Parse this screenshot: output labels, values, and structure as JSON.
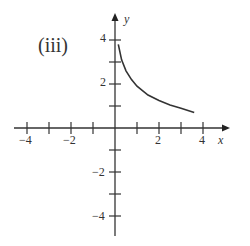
{
  "chart_data": {
    "type": "line",
    "title": "(iii)",
    "xlabel": "x",
    "ylabel": "y",
    "xlim": [
      -4.5,
      5
    ],
    "ylim": [
      -4.5,
      5
    ],
    "grid": false,
    "x_tick_labels": [
      "-4",
      "-2",
      "2",
      "4"
    ],
    "y_tick_labels": [
      "4",
      "2",
      "-2",
      "-4"
    ],
    "series": [
      {
        "name": "curve",
        "x": [
          0.15,
          0.3,
          0.5,
          0.75,
          1.0,
          1.5,
          2.0,
          2.5,
          3.0,
          3.6
        ],
        "y": [
          3.8,
          3.1,
          2.6,
          2.2,
          1.9,
          1.5,
          1.25,
          1.05,
          0.9,
          0.7
        ]
      }
    ],
    "color": "#333333"
  },
  "labels": {
    "panel": "(iii)",
    "x_axis": "x",
    "y_axis": "y",
    "xt_m4": "−4",
    "xt_m2": "−2",
    "xt_2": "2",
    "xt_4": "4",
    "yt_4": "4",
    "yt_2": "2",
    "yt_m2": "−2",
    "yt_m4": "−4"
  }
}
